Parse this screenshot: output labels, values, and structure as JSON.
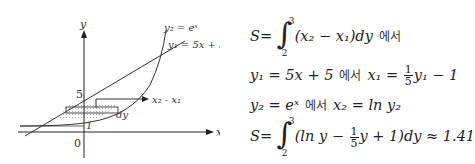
{
  "graph": {
    "axis_y_label": "y",
    "axis_x_label": "x",
    "origin_label": "0",
    "tick_5_label": "5",
    "tick_1_label": "1",
    "curve_exp_label": "y₂ = eˣ",
    "line_label": "y₁ = 5x + 5",
    "strip_arrow_label": "x₂ - x₁",
    "dy_label": "dy"
  },
  "formulas": {
    "line1": {
      "lhs": "S",
      "eq": "=",
      "upper": "3",
      "lower": "2",
      "integrand": "(x₂ − x₁)dy",
      "korean": "에서"
    },
    "line2": {
      "lhs": "y₁ = 5x + 5",
      "korean": "에서",
      "rhs_var": "x₁ =",
      "frac_num": "1",
      "frac_den": "5",
      "rhs_tail": "y₁ − 1"
    },
    "line3": {
      "lhs": "y₂ = eˣ",
      "korean": "에서",
      "rhs": "x₂ = ln y₂"
    },
    "line4": {
      "lhs": "S",
      "eq": "=",
      "upper": "3",
      "lower": "2",
      "integrand_head": "(ln y −",
      "frac_num": "1",
      "frac_den": "5",
      "integrand_tail": "y + 1)dy ≈ 1.41"
    }
  }
}
